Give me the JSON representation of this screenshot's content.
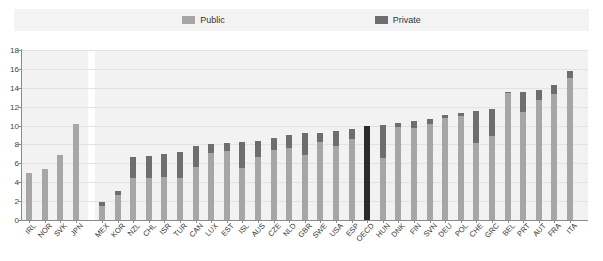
{
  "legend": {
    "items": [
      {
        "label": "Public",
        "color": "#a6a6a6",
        "name": "legend-public"
      },
      {
        "label": "Private",
        "color": "#6e6e6e",
        "name": "legend-private"
      }
    ]
  },
  "colors": {
    "public": "#a6a6a6",
    "private": "#6e6e6e",
    "highlight": "#2b2b2b",
    "panel": "#f2f2f2",
    "grid": "#e2e2e2",
    "axis": "#8a8a8a",
    "legend_band": "#f3f3f3"
  },
  "chart_data": {
    "type": "bar",
    "subtype": "stacked-bar",
    "title": "",
    "xlabel": "",
    "ylabel": "",
    "ylim": [
      0,
      18
    ],
    "yticks": [
      0,
      2,
      4,
      6,
      8,
      10,
      12,
      14,
      16,
      18
    ],
    "ytick_labels": [
      "0",
      "2",
      "4",
      "6",
      "8",
      "10",
      "12",
      "14",
      "16",
      "18"
    ],
    "grid": true,
    "legend_position": "top-center",
    "series": [
      {
        "name": "Public",
        "color": "#a6a6a6"
      },
      {
        "name": "Private",
        "color": "#6e6e6e"
      }
    ],
    "groups": [
      {
        "name": "group-left",
        "categories": [
          "IRL",
          "NOR",
          "SVK",
          "JPN"
        ],
        "public": [
          5.0,
          5.4,
          6.9,
          10.2
        ],
        "private": [
          0,
          0,
          0,
          0
        ],
        "totals": [
          5.0,
          5.4,
          6.9,
          10.2
        ]
      },
      {
        "name": "group-main",
        "categories": [
          "MEX",
          "KOR",
          "NZL",
          "CHL",
          "ISR",
          "TUR",
          "CAN",
          "LUX",
          "EST",
          "ISL",
          "AUS",
          "CZE",
          "NLD",
          "GBR",
          "SWE",
          "USA",
          "ESP",
          "OECD",
          "HUN",
          "DNK",
          "FIN",
          "SVN",
          "DEU",
          "POL",
          "CHE",
          "GRC",
          "BEL",
          "PRT",
          "AUT",
          "FRA",
          "ITA"
        ],
        "public": [
          1.5,
          2.6,
          4.5,
          4.4,
          4.6,
          4.5,
          5.6,
          7.1,
          7.3,
          5.5,
          6.7,
          7.4,
          7.6,
          6.9,
          8.3,
          7.8,
          8.6,
          9.9,
          6.6,
          9.9,
          9.7,
          10.2,
          10.8,
          11.0,
          8.2,
          8.9,
          13.4,
          11.4,
          12.7,
          13.3,
          15.0
        ],
        "private": [
          0.4,
          0.5,
          2.2,
          2.4,
          2.4,
          2.7,
          2.2,
          1.0,
          0.9,
          2.8,
          1.7,
          1.3,
          1.4,
          2.3,
          0.9,
          1.6,
          1.0,
          0.1,
          3.5,
          0.4,
          0.8,
          0.5,
          0.3,
          0.3,
          3.3,
          2.9,
          0.2,
          2.2,
          1.1,
          1.0,
          0.8
        ],
        "totals": [
          1.9,
          3.1,
          6.7,
          6.8,
          7.0,
          7.2,
          7.8,
          8.1,
          8.2,
          8.3,
          8.4,
          8.7,
          9.0,
          9.2,
          9.2,
          9.4,
          9.6,
          10.0,
          10.1,
          10.3,
          10.5,
          10.7,
          11.1,
          11.3,
          11.5,
          11.8,
          13.6,
          13.6,
          13.8,
          14.3,
          15.8
        ],
        "highlight": "OECD"
      }
    ]
  }
}
